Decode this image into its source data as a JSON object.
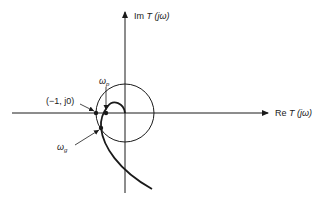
{
  "diagram": {
    "type": "nyquist-plot",
    "axes": {
      "imag_label_prefix": "Im ",
      "imag_label_T": "T",
      "imag_label_arg": " (jω)",
      "real_label_prefix": "Re ",
      "real_label_T": "T",
      "real_label_arg": " (jω)"
    },
    "annotations": {
      "critical_point": "(−1, j0)",
      "phase_crossover_symbol": "ω",
      "phase_crossover_sub": "p",
      "gain_crossover_symbol": "ω",
      "gain_crossover_sub": "g"
    },
    "elements": [
      "real-axis",
      "imaginary-axis",
      "unit-circle",
      "nyquist-curve",
      "critical-point",
      "phase-crossover-point",
      "gain-crossover-point"
    ]
  }
}
